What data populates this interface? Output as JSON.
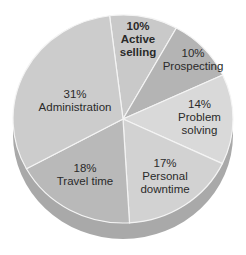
{
  "chart_data": {
    "type": "pie",
    "title": "",
    "style": "3d",
    "slices": [
      {
        "label": "Active selling",
        "value": 10,
        "pct_label": "10%",
        "color": "#c9c9c9",
        "bold": true
      },
      {
        "label": "Prospecting",
        "value": 10,
        "pct_label": "10%",
        "color": "#b4b4b4",
        "bold": false
      },
      {
        "label": "Problem solving",
        "value": 14,
        "pct_label": "14%",
        "color": "#d9d9d9",
        "bold": false
      },
      {
        "label": "Personal downtime",
        "value": 17,
        "pct_label": "17%",
        "color": "#d2d2d2",
        "bold": false
      },
      {
        "label": "Travel time",
        "value": 18,
        "pct_label": "18%",
        "color": "#b9b9b9",
        "bold": false
      },
      {
        "label": "Administration",
        "value": 31,
        "pct_label": "31%",
        "color": "#cccccc",
        "bold": false
      }
    ]
  },
  "labels": {
    "active_selling": {
      "pct": "10%",
      "line1": "Active",
      "line2": "selling"
    },
    "prospecting": {
      "pct": "10%",
      "line1": "Prospecting"
    },
    "problem_solving": {
      "pct": "14%",
      "line1": "Problem",
      "line2": "solving"
    },
    "personal_downtime": {
      "pct": "17%",
      "line1": "Personal",
      "line2": "downtime"
    },
    "travel_time": {
      "pct": "18%",
      "line1": "Travel time"
    },
    "administration": {
      "pct": "31%",
      "line1": "Administration"
    }
  }
}
